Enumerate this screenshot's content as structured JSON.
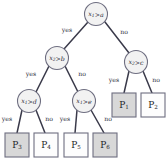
{
  "diagram": {
    "type": "decision-tree",
    "title": "",
    "colors": {
      "node_fill": "#f2f2f2",
      "node_stroke": "#6e6e80",
      "edge_stroke": "#3a3a4a",
      "leaf_shaded_fill": "#d8d8d8",
      "leaf_plain_fill": "#fdfdfd",
      "text": "#2b2b38",
      "background": "#ffffff"
    },
    "nodes": [
      {
        "id": "root",
        "kind": "decision",
        "var": "x",
        "var_sub": "1",
        "op": ">",
        "threshold": "a",
        "cx": 96,
        "cy": 14,
        "r": 11.5
      },
      {
        "id": "n-left",
        "kind": "decision",
        "var": "x",
        "var_sub": "2",
        "op": ">",
        "threshold": "b",
        "cx": 57,
        "cy": 58,
        "r": 11.5
      },
      {
        "id": "n-right",
        "kind": "decision",
        "var": "x",
        "var_sub": "2",
        "op": ">",
        "threshold": "c",
        "cx": 136,
        "cy": 62,
        "r": 11.5
      },
      {
        "id": "n-left-left",
        "kind": "decision",
        "var": "x",
        "var_sub": "1",
        "op": ">",
        "threshold": "d",
        "cx": 29,
        "cy": 101,
        "r": 11.5
      },
      {
        "id": "n-left-right",
        "kind": "decision",
        "var": "x",
        "var_sub": "1",
        "op": ">",
        "threshold": "e",
        "cx": 84,
        "cy": 101,
        "r": 11.5
      }
    ],
    "leaves": [
      {
        "id": "leaf-p3",
        "label": "P",
        "sub": "3",
        "shaded": true,
        "x": 5,
        "y": 133,
        "w": 24,
        "h": 24
      },
      {
        "id": "leaf-p4",
        "label": "P",
        "sub": "4",
        "shaded": false,
        "x": 34,
        "y": 133,
        "w": 24,
        "h": 24
      },
      {
        "id": "leaf-p5",
        "label": "P",
        "sub": "5",
        "shaded": false,
        "x": 64,
        "y": 133,
        "w": 24,
        "h": 24
      },
      {
        "id": "leaf-p6",
        "label": "P",
        "sub": "6",
        "shaded": true,
        "x": 93,
        "y": 133,
        "w": 24,
        "h": 24
      },
      {
        "id": "leaf-p1",
        "label": "P",
        "sub": "1",
        "shaded": true,
        "x": 112,
        "y": 93,
        "w": 24,
        "h": 24
      },
      {
        "id": "leaf-p2",
        "label": "P",
        "sub": "2",
        "shaded": false,
        "x": 141,
        "y": 93,
        "w": 24,
        "h": 24
      }
    ],
    "edges": [
      {
        "id": "e-root-left",
        "from": "root",
        "to": "n-left",
        "label": "yes",
        "x1": 88,
        "y1": 22,
        "x2": 64,
        "y2": 49,
        "lx": 67,
        "ly": 30
      },
      {
        "id": "e-root-right",
        "from": "root",
        "to": "n-right",
        "label": "no",
        "x1": 105,
        "y1": 22,
        "x2": 129,
        "y2": 53,
        "lx": 124,
        "ly": 32
      },
      {
        "id": "e-left-left",
        "from": "n-left",
        "to": "n-left-left",
        "label": "yes",
        "x1": 49,
        "y1": 66,
        "x2": 36,
        "y2": 92,
        "lx": 31,
        "ly": 74
      },
      {
        "id": "e-left-right",
        "from": "n-left",
        "to": "n-left-right",
        "label": "no",
        "x1": 65,
        "y1": 66,
        "x2": 78,
        "y2": 92,
        "lx": 82,
        "ly": 74
      },
      {
        "id": "e-right-left",
        "from": "n-right",
        "to": "leaf-p1",
        "label": "yes",
        "x1": 129,
        "y1": 71,
        "x2": 124,
        "y2": 93,
        "lx": 114,
        "ly": 80
      },
      {
        "id": "e-right-right",
        "from": "n-right",
        "to": "leaf-p2",
        "label": "no",
        "x1": 143,
        "y1": 71,
        "x2": 152,
        "y2": 93,
        "lx": 156,
        "ly": 80
      },
      {
        "id": "e-ll-left",
        "from": "n-left-left",
        "to": "leaf-p3",
        "label": "yes",
        "x1": 22,
        "y1": 110,
        "x2": 17,
        "y2": 133,
        "lx": 7,
        "ly": 119
      },
      {
        "id": "e-ll-right",
        "from": "n-left-left",
        "to": "leaf-p4",
        "label": "no",
        "x1": 36,
        "y1": 110,
        "x2": 45,
        "y2": 133,
        "lx": 49,
        "ly": 119
      },
      {
        "id": "e-lr-left",
        "from": "n-left-right",
        "to": "leaf-p5",
        "label": "yes",
        "x1": 77,
        "y1": 110,
        "x2": 75,
        "y2": 133,
        "lx": 65,
        "ly": 119
      },
      {
        "id": "e-lr-right",
        "from": "n-left-right",
        "to": "leaf-p6",
        "label": "no",
        "x1": 91,
        "y1": 110,
        "x2": 104,
        "y2": 133,
        "lx": 108,
        "ly": 119
      }
    ]
  }
}
